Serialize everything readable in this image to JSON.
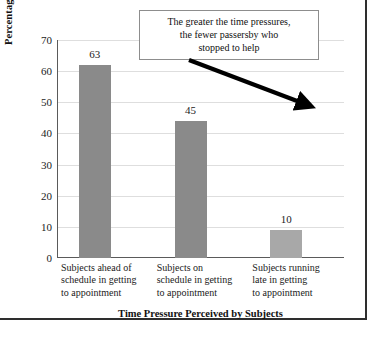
{
  "chart_data": {
    "type": "bar",
    "categories": [
      "Subjects ahead of schedule in getting to appointment",
      "Subjects on schedule in getting to appointment",
      "Subjects running late in getting to appointment"
    ],
    "category_lines": [
      [
        "Subjects ahead of",
        "schedule in getting",
        "to appointment"
      ],
      [
        "Subjects on",
        "schedule in getting",
        "to appointment"
      ],
      [
        "Subjects running",
        "late in getting",
        "to appointment"
      ]
    ],
    "values": [
      63,
      45,
      10
    ],
    "value_labels": [
      "63",
      "45",
      "10"
    ],
    "title": "",
    "xlabel": "Time Pressure Perceived by Subjects",
    "ylabel": "Percentage of Subjects Offering Help",
    "ylim": [
      0,
      70
    ],
    "ytick_labels": [
      "0",
      "10",
      "20",
      "30",
      "40",
      "50",
      "60",
      "70"
    ],
    "ytick_values": [
      0,
      10,
      20,
      30,
      40,
      50,
      60,
      70
    ],
    "grid": true,
    "legend": false,
    "bar_colors": [
      "#8a8a8a",
      "#8a8a8a",
      "#a8a8a8"
    ],
    "gridline_color": "#dedede",
    "axis_color": "#5a5a5a",
    "annotations": [
      {
        "name": "callout",
        "lines": [
          "The greater the time pressures,",
          "the fewer passersby who",
          "stopped to help"
        ],
        "arrow": "points down-right toward third bar"
      }
    ]
  }
}
